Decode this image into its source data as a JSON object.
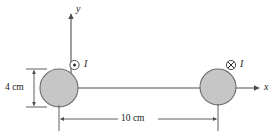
{
  "figure": {
    "background_color": "#ffffff",
    "stroke_color": "#4d4d4d",
    "text_color": "#1a1a1a",
    "conductor_fill": "#c6c6c6",
    "conductor_stroke": "#6b6b6b",
    "axes": {
      "y_axis_label": "y",
      "x_axis_label": "x",
      "origin_note": "origin at left conductor center"
    },
    "conductors": [
      {
        "id": "left-conductor",
        "current_label": "I",
        "current_direction": "out-of-page",
        "current_symbol": "dot-in-circle",
        "cx": 59,
        "cy": 88,
        "r": 19
      },
      {
        "id": "right-conductor",
        "current_label": "I",
        "current_direction": "into-page",
        "current_symbol": "cross-in-circle",
        "cx": 218,
        "cy": 87,
        "r": 18
      }
    ],
    "dimensions": [
      {
        "id": "vertical-dimension",
        "label": "4 cm",
        "orientation": "vertical",
        "measures": "left-conductor-diameter"
      },
      {
        "id": "horizontal-dimension",
        "label": "10 cm",
        "orientation": "horizontal",
        "measures": "center-to-center-separation"
      }
    ]
  }
}
